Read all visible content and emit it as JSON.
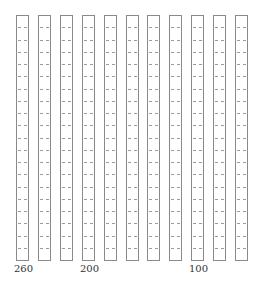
{
  "diagram": {
    "type": "column-bar-grid",
    "column_count": 11,
    "segments_per_column": 20,
    "column_values": [
      260,
      240,
      220,
      200,
      180,
      160,
      140,
      120,
      100,
      80,
      60
    ],
    "labels": [
      {
        "column_index": 0,
        "text": "260"
      },
      {
        "column_index": 3,
        "text": "200"
      },
      {
        "column_index": 8,
        "text": "100"
      }
    ],
    "colors": {
      "border": "#8a8a8a",
      "dash": "#9a9a9a",
      "label": "#333333",
      "background": "#ffffff"
    }
  }
}
